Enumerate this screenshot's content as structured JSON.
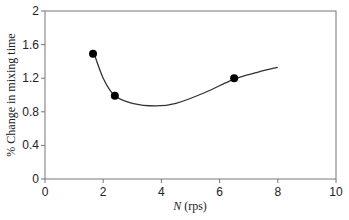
{
  "chart_data": {
    "type": "scatter",
    "title": "",
    "xlabel": "N (rps)",
    "xlabel_italic_part": "N",
    "xlabel_rest": " (rps)",
    "ylabel": "% Change in mixing time",
    "xlim": [
      0,
      10
    ],
    "ylim": [
      0,
      2
    ],
    "xticks": [
      0,
      2,
      4,
      6,
      8,
      10
    ],
    "yticks": [
      0,
      0.4,
      0.8,
      1.2,
      1.6,
      2
    ],
    "ytick_labels": [
      "0",
      "0.4",
      "0.8",
      "1.2",
      "1.6",
      "2"
    ],
    "grid": false,
    "legend": null,
    "series": [
      {
        "name": "measured",
        "marker": "filled-circle",
        "x": [
          1.65,
          2.4,
          6.5
        ],
        "y": [
          1.49,
          0.99,
          1.2
        ]
      },
      {
        "name": "fit-curve",
        "style": "smooth-line",
        "x": [
          1.65,
          2.0,
          2.4,
          3.0,
          3.8,
          4.5,
          5.5,
          6.5,
          7.3,
          8.0
        ],
        "y": [
          1.53,
          1.2,
          0.99,
          0.9,
          0.87,
          0.9,
          1.03,
          1.19,
          1.27,
          1.33
        ]
      }
    ]
  },
  "colors": {
    "axis": "#777777",
    "line": "#333333",
    "marker": "#000000"
  }
}
